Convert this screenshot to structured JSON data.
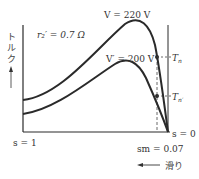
{
  "diagram": {
    "y_axis_label_chars": [
      "ト",
      "ル",
      "ク"
    ],
    "y_axis_label": "トルク",
    "x_axis_direction_label": "滑り",
    "resistance_label": "r₂′ = 0.7 Ω",
    "curves": [
      {
        "name": "V = 220 V",
        "voltage_V": 220
      },
      {
        "name": "V′ = 200 V",
        "voltage_V": 200
      }
    ],
    "points": [
      {
        "label": "Tn",
        "sub": "n"
      },
      {
        "label": "Tn′",
        "sub": "n′"
      }
    ],
    "slip_labels": {
      "left": "s = 1",
      "right": "s = 0",
      "marker": "sm = 0.07"
    },
    "colors": {
      "line": "#2a2a2a",
      "text": "#333333"
    }
  }
}
